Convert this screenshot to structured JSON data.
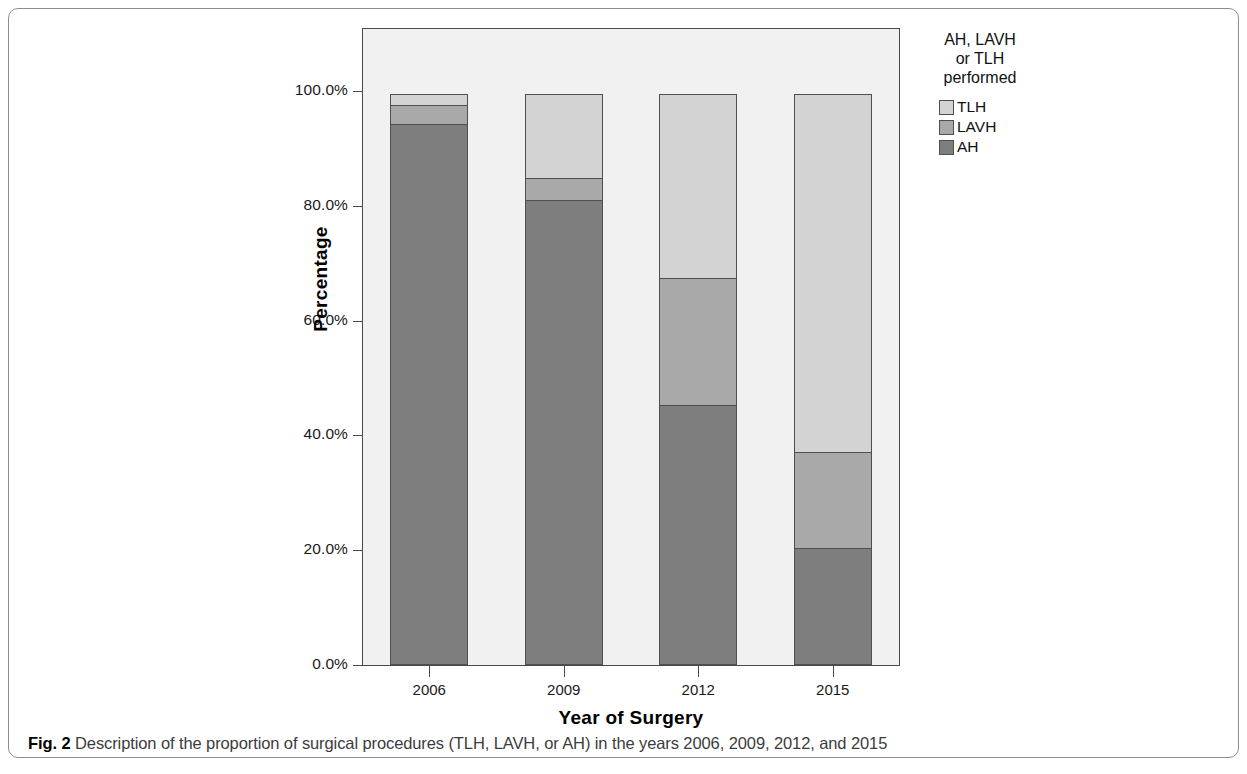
{
  "caption": {
    "label": "Fig. 2",
    "text": " Description of the proportion of surgical procedures (TLH, LAVH, or AH) in the years 2006, 2009, 2012, and 2015"
  },
  "legend": {
    "title_line1": "AH, LAVH",
    "title_line2": "or TLH",
    "title_line3": "performed",
    "items": [
      {
        "label": "TLH",
        "color": "#d3d3d3"
      },
      {
        "label": "LAVH",
        "color": "#a9a9a9"
      },
      {
        "label": "AH",
        "color": "#7e7e7e"
      }
    ]
  },
  "axes": {
    "y_title": "Percentage",
    "x_title": "Year of Surgery",
    "y_ticks": [
      "0.0%",
      "20.0%",
      "40.0%",
      "60.0%",
      "80.0%",
      "100.0%"
    ]
  },
  "chart_data": {
    "type": "bar",
    "stacked": true,
    "title": "",
    "xlabel": "Year of Surgery",
    "ylabel": "Percentage",
    "ylim": [
      0,
      100
    ],
    "yticks": [
      0,
      20,
      40,
      60,
      80,
      100
    ],
    "ytick_labels": [
      "0.0%",
      "20.0%",
      "40.0%",
      "60.0%",
      "80.0%",
      "100.0%"
    ],
    "grid": false,
    "legend_position": "right",
    "legend_title": "AH, LAVH or TLH performed",
    "categories": [
      "2006",
      "2009",
      "2012",
      "2015"
    ],
    "series": [
      {
        "name": "AH",
        "color": "#7e7e7e",
        "values": [
          94.3,
          81.0,
          45.3,
          20.3
        ]
      },
      {
        "name": "LAVH",
        "color": "#a9a9a9",
        "values": [
          3.5,
          4.0,
          22.3,
          17.0
        ]
      },
      {
        "name": "TLH",
        "color": "#d3d3d3",
        "values": [
          2.2,
          15.0,
          32.4,
          62.7
        ]
      }
    ]
  }
}
